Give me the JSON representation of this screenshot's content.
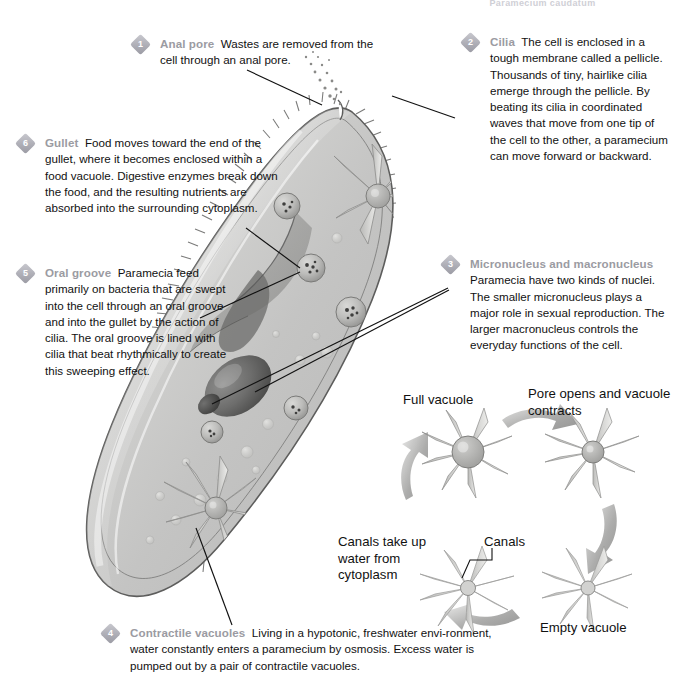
{
  "page": {
    "running_head": "Paramecium caudatum",
    "background": "#ffffff",
    "heading_color": "#9b9ba2",
    "badge_color": "#aeaeb6",
    "text_color": "#111111"
  },
  "callouts": [
    {
      "number": "1",
      "heading": "Anal pore",
      "body": "Wastes are removed from the cell through an anal pore."
    },
    {
      "number": "2",
      "heading": "Cilia",
      "body": "The cell is enclosed in a tough membrane called a pellicle. Thousands of tiny, hairlike cilia emerge through the pellicle. By beating its cilia in coordinated waves that move from one tip of the cell to the other, a paramecium can move forward or backward."
    },
    {
      "number": "3",
      "heading": "Micronucleus and macronucleus",
      "body": "Paramecia have two kinds of nuclei. The smaller micronucleus plays a major role in sexual reproduction. The larger macronucleus controls the everyday functions of the cell."
    },
    {
      "number": "4",
      "heading": "Contractile vacuoles",
      "body": "Living in a hypotonic, freshwater envi-ronment, water constantly enters a paramecium by osmosis. Excess water is pumped out by a pair of contractile vacuoles."
    },
    {
      "number": "5",
      "heading": "Oral groove",
      "body": "Paramecia feed primarily on bacteria that are swept into the cell through an oral groove and into the gullet by the action of cilia. The oral groove is lined with cilia that beat rhythmically to create this sweeping effect."
    },
    {
      "number": "6",
      "heading": "Gullet",
      "body": "Food moves toward the end of the gullet, where it becomes enclosed within a food vacuole. Digestive enzymes break down the food, and the resulting nutrients are absorbed into the surrounding cytoplasm."
    }
  ],
  "vacuole_cycle": {
    "title": "Contractile vacuole cycle",
    "stages": [
      {
        "id": "full",
        "label": "Full vacuole"
      },
      {
        "id": "pore",
        "label": "Pore opens and vacuole contracts"
      },
      {
        "id": "empty",
        "label": "Empty vacuole"
      },
      {
        "id": "canals-uptake",
        "label": "Canals take up water from cytoplasm"
      }
    ],
    "part_label": "Canals"
  },
  "organism": {
    "name": "paramecium",
    "structures": [
      "pellicle",
      "cilia",
      "anal pore",
      "gullet",
      "oral groove",
      "food vacuole",
      "macronucleus",
      "micronucleus",
      "contractile vacuole"
    ]
  }
}
